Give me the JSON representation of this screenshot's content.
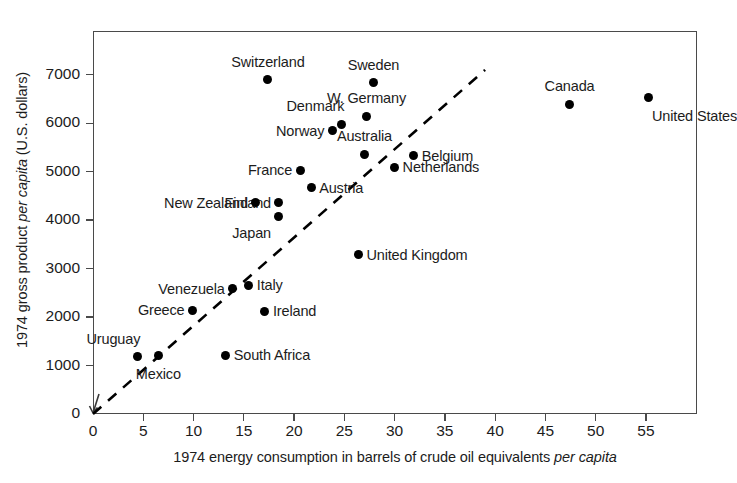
{
  "chart_data": {
    "type": "scatter",
    "title": "",
    "xlabel_parts": {
      "plain": "1974 energy consumption in barrels of crude oil equivalents ",
      "italic": "per capita"
    },
    "ylabel_parts": {
      "pre": "1974 gross product ",
      "italic": "per capita",
      "post": " (U.S. dollars)"
    },
    "xlabel": "1974 energy consumption in barrels of crude oil equivalents per capita",
    "ylabel": "1974 gross product per capita (U.S. dollars)",
    "xlim": [
      0,
      60
    ],
    "ylim": [
      0,
      7600
    ],
    "grid": false,
    "legend": "none",
    "xticks": [
      0,
      5,
      10,
      15,
      20,
      25,
      30,
      35,
      40,
      45,
      50,
      55
    ],
    "yticks": [
      0,
      1000,
      2000,
      3000,
      4000,
      5000,
      6000,
      7000
    ],
    "xtick_labels": [
      "0",
      "5",
      "10",
      "15",
      "20",
      "25",
      "30",
      "35",
      "40",
      "45",
      "50",
      "55"
    ],
    "ytick_labels": [
      "0",
      "1000",
      "2000",
      "3000",
      "4000",
      "5000",
      "6000",
      "7000"
    ],
    "reference_line": {
      "style": "dashed",
      "from": [
        0,
        0
      ],
      "to": [
        39.0,
        7100
      ],
      "color": "#000000"
    },
    "marker_color": "#000000",
    "points": [
      {
        "label": "Switzerland",
        "x": 17.4,
        "y": 6900,
        "label_pos": "above"
      },
      {
        "label": "Sweden",
        "x": 27.9,
        "y": 6830,
        "label_pos": "above"
      },
      {
        "label": "W. Germany",
        "x": 27.2,
        "y": 6140,
        "label_pos": "above"
      },
      {
        "label": "Denmark",
        "x": 24.7,
        "y": 5980,
        "label_pos": "above-left"
      },
      {
        "label": "Norway",
        "x": 23.8,
        "y": 5840,
        "label_pos": "left"
      },
      {
        "label": "Australia",
        "x": 27.0,
        "y": 5360,
        "label_pos": "above"
      },
      {
        "label": "Belgium",
        "x": 31.9,
        "y": 5330,
        "label_pos": "right"
      },
      {
        "label": "Netherlands",
        "x": 30.0,
        "y": 5090,
        "label_pos": "right"
      },
      {
        "label": "France",
        "x": 20.6,
        "y": 5030,
        "label_pos": "left"
      },
      {
        "label": "Austria",
        "x": 21.7,
        "y": 4670,
        "label_pos": "right"
      },
      {
        "label": "Finland",
        "x": 18.5,
        "y": 4360,
        "label_pos": "left"
      },
      {
        "label": "New Zealand",
        "x": 16.2,
        "y": 4360,
        "label_pos": "left"
      },
      {
        "label": "Japan",
        "x": 18.5,
        "y": 4080,
        "label_pos": "below-left"
      },
      {
        "label": "Canada",
        "x": 47.4,
        "y": 6390,
        "label_pos": "above"
      },
      {
        "label": "United States",
        "x": 55.3,
        "y": 6530,
        "label_pos": "below-right"
      },
      {
        "label": "United Kingdom",
        "x": 26.4,
        "y": 3290,
        "label_pos": "right"
      },
      {
        "label": "Italy",
        "x": 15.5,
        "y": 2660,
        "label_pos": "right"
      },
      {
        "label": "Venezuela",
        "x": 13.9,
        "y": 2580,
        "label_pos": "left"
      },
      {
        "label": "Greece",
        "x": 9.9,
        "y": 2140,
        "label_pos": "left"
      },
      {
        "label": "Ireland",
        "x": 17.1,
        "y": 2120,
        "label_pos": "right"
      },
      {
        "label": "South Africa",
        "x": 13.2,
        "y": 1210,
        "label_pos": "right"
      },
      {
        "label": "Mexico",
        "x": 6.5,
        "y": 1200,
        "label_pos": "below"
      },
      {
        "label": "Uruguay",
        "x": 4.4,
        "y": 1180,
        "label_pos": "above-left"
      }
    ]
  }
}
